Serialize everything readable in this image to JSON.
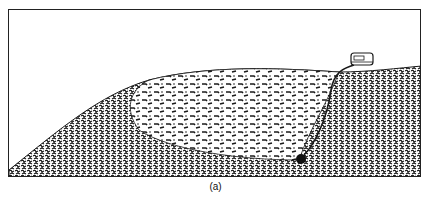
{
  "figure": {
    "caption": "(a)",
    "elements": {
      "terrain": "hill-cross-section",
      "zone": "disturbed-soil-region",
      "device": "surface-instrument-box",
      "cable": "sensor-cable",
      "sensor": "buried-sensor"
    },
    "colors": {
      "ink": "#1a1a1a",
      "background": "#ffffff"
    }
  }
}
